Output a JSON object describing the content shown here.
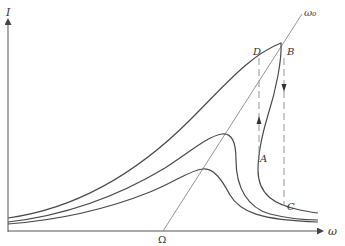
{
  "diagram": {
    "type": "resonance curves with hysteresis (nonlinear oscillator)",
    "axes": {
      "y_label": "I",
      "x_label": "ω"
    },
    "line_labels": {
      "backbone": "ω₀",
      "intercept": "Ω"
    },
    "points": {
      "A": "A",
      "B": "B",
      "C": "C",
      "D": "D"
    },
    "curves": [
      {
        "name": "outer-curve",
        "description": "largest amplitude, bent over with jump points D, B, A, C"
      },
      {
        "name": "middle-curve",
        "description": "medium amplitude, peak near backbone line"
      },
      {
        "name": "inner-curve",
        "description": "smallest amplitude, peak near backbone line"
      }
    ],
    "jumps": [
      {
        "from": "B",
        "to": "C",
        "direction": "down"
      },
      {
        "from": "A",
        "to": "D",
        "direction": "up"
      }
    ],
    "colors": {
      "curve": "#4a4a4a",
      "axis": "#555555",
      "backbone": "#8a8a8a",
      "dashed": "#8a8a8a"
    }
  }
}
